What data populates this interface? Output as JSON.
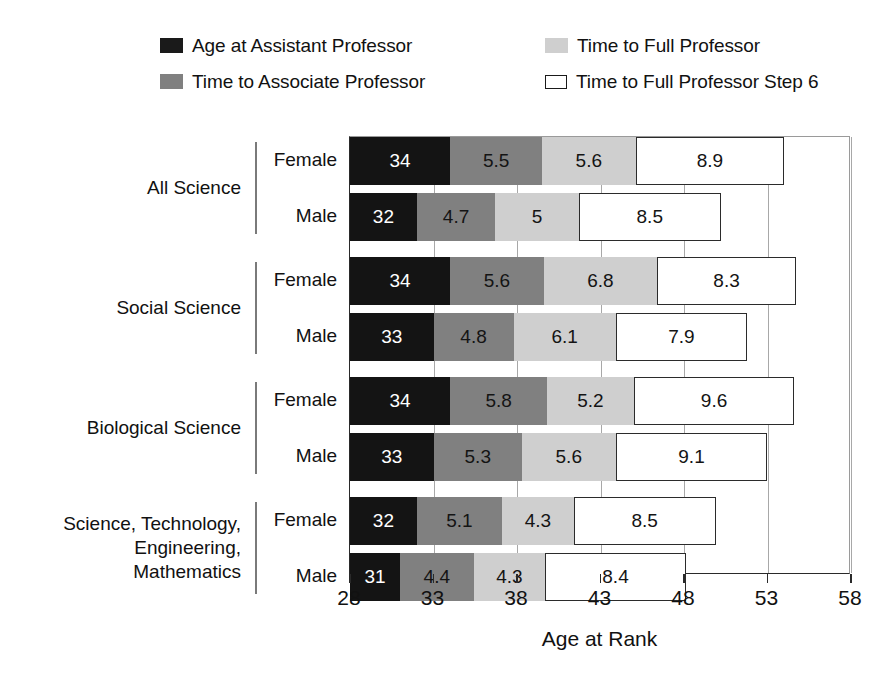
{
  "chart_data": {
    "type": "bar",
    "orientation": "horizontal",
    "stacked": true,
    "title": "",
    "xlabel": "Age at Rank",
    "ylabel": "",
    "xlim": [
      28,
      58
    ],
    "xticks": [
      28,
      33,
      38,
      43,
      48,
      53,
      58
    ],
    "grid": true,
    "legend_position": "top",
    "series": [
      {
        "name": "Age at Assistant Professor",
        "color": "#141414",
        "swatch": "black"
      },
      {
        "name": "Time to Associate Professor",
        "color": "#808080",
        "swatch": "mid"
      },
      {
        "name": "Time to Full Professor",
        "color": "#cfcfcf",
        "swatch": "light"
      },
      {
        "name": "Time to Full Professor Step 6",
        "color": "#ffffff",
        "swatch": "open"
      }
    ],
    "groups": [
      {
        "name": "All Science",
        "rows": [
          {
            "sex": "Female",
            "values": [
              34,
              5.5,
              5.6,
              8.9
            ],
            "labels": [
              "34",
              "5.5",
              "5.6",
              "8.9"
            ]
          },
          {
            "sex": "Male",
            "values": [
              32,
              4.7,
              5,
              8.5
            ],
            "labels": [
              "32",
              "4.7",
              "5",
              "8.5"
            ]
          }
        ]
      },
      {
        "name": "Social Science",
        "rows": [
          {
            "sex": "Female",
            "values": [
              34,
              5.6,
              6.8,
              8.3
            ],
            "labels": [
              "34",
              "5.6",
              "6.8",
              "8.3"
            ]
          },
          {
            "sex": "Male",
            "values": [
              33,
              4.8,
              6.1,
              7.9
            ],
            "labels": [
              "33",
              "4.8",
              "6.1",
              "7.9"
            ]
          }
        ]
      },
      {
        "name": "Biological Science",
        "rows": [
          {
            "sex": "Female",
            "values": [
              34,
              5.8,
              5.2,
              9.6
            ],
            "labels": [
              "34",
              "5.8",
              "5.2",
              "9.6"
            ]
          },
          {
            "sex": "Male",
            "values": [
              33,
              5.3,
              5.6,
              9.1
            ],
            "labels": [
              "33",
              "5.3",
              "5.6",
              "9.1"
            ]
          }
        ]
      },
      {
        "name": "Science, Technology,\nEngineering,\nMathematics",
        "rows": [
          {
            "sex": "Female",
            "values": [
              32,
              5.1,
              4.3,
              8.5
            ],
            "labels": [
              "32",
              "5.1",
              "4.3",
              "8.5"
            ]
          },
          {
            "sex": "Male",
            "values": [
              31,
              4.4,
              4.3,
              8.4
            ],
            "labels": [
              "31",
              "4.4",
              "4.3",
              "8.4"
            ]
          }
        ]
      }
    ]
  },
  "legend": {
    "items": [
      {
        "label": "Age at Assistant Professor",
        "swatch": "black",
        "col": "col-left",
        "row": "row-1"
      },
      {
        "label": "Time to Associate Professor",
        "swatch": "mid",
        "col": "col-left",
        "row": "row-2"
      },
      {
        "label": "Time to Full Professor",
        "swatch": "light",
        "col": "col-right",
        "row": "row-1"
      },
      {
        "label": "Time to Full Professor Step 6",
        "swatch": "open",
        "col": "col-right",
        "row": "row-2"
      }
    ]
  },
  "axis": {
    "x_title": "Age at Rank",
    "x_tick_labels": [
      "28",
      "33",
      "38",
      "43",
      "48",
      "53",
      "58"
    ]
  },
  "colors": {
    "assistant": "#141414",
    "associate": "#808080",
    "full": "#cfcfcf",
    "full_step6": "#ffffff",
    "axis": "#2a2a2a",
    "grid": "#a8a8a8"
  }
}
